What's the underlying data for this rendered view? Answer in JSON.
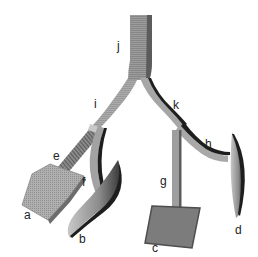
{
  "diagram": {
    "labels": {
      "a": "a",
      "b": "b",
      "c": "c",
      "d": "d",
      "e": "e",
      "f": "f",
      "g": "g",
      "h": "h",
      "i": "i",
      "j": "j",
      "k": "k"
    },
    "colors": {
      "trunk": "#9a9a9a",
      "trunk_shade": "#6a6a6a",
      "light_branch": "#b8b8b8",
      "dark_edge": "#1e1e1e",
      "square_a": "#a8a8a8",
      "square_c": "#7c7c7c",
      "leaf": "#8a8a8a"
    }
  }
}
